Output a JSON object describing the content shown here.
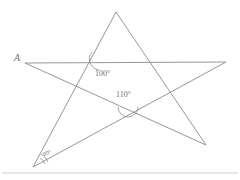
{
  "figure": {
    "type": "geometry-diagram",
    "background_color": "#ffffff",
    "line_color": "#8a8a8a",
    "baseline_color": "#c8c8c8",
    "vertex_label": "A",
    "angles": [
      {
        "name": "angle-100",
        "value": "100°"
      },
      {
        "name": "angle-110",
        "value": "110°"
      },
      {
        "name": "angle-80",
        "value": "80°"
      }
    ],
    "star_points": {
      "top": [
        116,
        12
      ],
      "right": [
        226,
        62
      ],
      "bottom_right": [
        206,
        145
      ],
      "bottom_left": [
        33,
        167
      ],
      "left": [
        25,
        63
      ]
    },
    "star_path": "M116,12 L206,145 L25,63 L226,62 L33,167 Z",
    "arcs": {
      "angle_100_path": "M 92,52 A 11,11 0 0 0 99,70",
      "angle_110_path": "M 118,107 A 10,10 0 0 0 138,107",
      "angle_80_path_outer": "M 48,162 A 15,15 0 0 0 41,154",
      "angle_80_path_inner": "M 45,164 A 11,11 0 0 0 40,158"
    },
    "baseline_y": 173
  }
}
